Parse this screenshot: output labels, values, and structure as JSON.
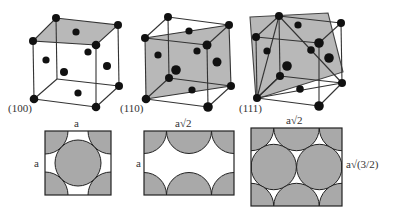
{
  "figure": {
    "colors": {
      "plane_fill": "#b5b5b5",
      "atom": "#111111",
      "edge": "#333333",
      "packing_fill": "#a9a9a9",
      "background": "#ffffff"
    },
    "cubes": [
      {
        "plane": "(100)",
        "label": "(100)"
      },
      {
        "plane": "(110)",
        "label": "(110)"
      },
      {
        "plane": "(111)",
        "label": "(111)"
      }
    ],
    "packing": [
      {
        "plane": "(100)",
        "width_label": "a",
        "height_label": "a"
      },
      {
        "plane": "(110)",
        "width_label": "a√2",
        "height_label": "a"
      },
      {
        "plane": "(111)",
        "width_label": "a√2",
        "height_label": "a√(3/2)"
      }
    ]
  }
}
